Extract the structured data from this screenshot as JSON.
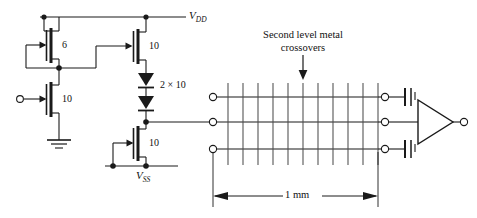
{
  "figure": {
    "domain": "circuit-schematic",
    "width": 477,
    "height": 218,
    "background_color": "#ffffff",
    "line_color": "#1a1a1a",
    "grid_line_color": "#555555"
  },
  "rails": {
    "vdd_label": "V",
    "vdd_sub": "DD",
    "vss_label": "V",
    "vss_sub": "SS"
  },
  "transistors": [
    {
      "id": "m1-load",
      "label": "6",
      "type": "nmos-depletion",
      "role": "load-device"
    },
    {
      "id": "m2-input",
      "label": "10",
      "type": "nmos",
      "role": "input-driver"
    },
    {
      "id": "m3-pullup",
      "label": "10",
      "type": "nmos",
      "role": "pull-up"
    },
    {
      "id": "m4-pulldown",
      "label": "10",
      "type": "nmos",
      "role": "pull-down"
    }
  ],
  "diodes": {
    "label": "2 × 10",
    "count": 2,
    "name": "level-shift-diodes"
  },
  "annotation": {
    "line1": "Second level metal",
    "line2": "crossovers",
    "arrow": "down-arrow"
  },
  "interconnect": {
    "rows": 3,
    "crossover_count": 11,
    "left_terminals": 3,
    "right_terminals": 3
  },
  "capacitors": {
    "count": 2,
    "name": "load-capacitor"
  },
  "inverter": {
    "name": "output-inverter",
    "shape": "triangle"
  },
  "dimension": {
    "label": "1 mm",
    "arrow_style": "double-headed"
  }
}
